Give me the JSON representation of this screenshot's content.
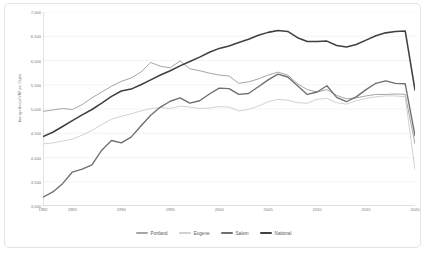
{
  "chart_data": {
    "type": "line",
    "title": "",
    "xlabel": "",
    "ylabel": "Average Annual VMT per Capita",
    "xlim": [
      1982,
      2020
    ],
    "ylim": [
      3000,
      7000
    ],
    "grid": true,
    "legend_position": "bottom",
    "ytick_labels": [
      "7,000",
      "6,500",
      "6,000",
      "5,500",
      "5,000",
      "4,500",
      "4,000",
      "3,500",
      "3,000"
    ],
    "ytick_values": [
      7000,
      6500,
      6000,
      5500,
      5000,
      4500,
      4000,
      3500,
      3000
    ],
    "xtick_labels": [
      "1982",
      "1985",
      "1990",
      "1995",
      "2000",
      "2005",
      "2010",
      "2015",
      "2020"
    ],
    "xtick_values": [
      1982,
      1985,
      1990,
      1995,
      2000,
      2005,
      2010,
      2015,
      2020
    ],
    "x": [
      1982,
      1983,
      1984,
      1985,
      1986,
      1987,
      1988,
      1989,
      1990,
      1991,
      1992,
      1993,
      1994,
      1995,
      1996,
      1997,
      1998,
      1999,
      2000,
      2001,
      2002,
      2003,
      2004,
      2005,
      2006,
      2007,
      2008,
      2009,
      2010,
      2011,
      2012,
      2013,
      2014,
      2015,
      2016,
      2017,
      2018,
      2019,
      2020
    ],
    "series": [
      {
        "name": "Portland",
        "color": "#a6a6a6",
        "width": 1.0,
        "values": [
          4950,
          4980,
          5010,
          4990,
          5090,
          5230,
          5350,
          5470,
          5570,
          5640,
          5760,
          5960,
          5880,
          5850,
          5990,
          5830,
          5790,
          5740,
          5700,
          5680,
          5530,
          5560,
          5620,
          5700,
          5760,
          5700,
          5520,
          5400,
          5350,
          5400,
          5280,
          5210,
          5230,
          5270,
          5300,
          5300,
          5310,
          5300,
          4280
        ]
      },
      {
        "name": "Eugene",
        "color": "#d2d2d2",
        "width": 1.0,
        "values": [
          4280,
          4300,
          4340,
          4380,
          4460,
          4560,
          4680,
          4790,
          4850,
          4900,
          4960,
          5010,
          5030,
          5010,
          5060,
          5040,
          5010,
          5020,
          5050,
          5040,
          4960,
          4990,
          5060,
          5150,
          5200,
          5180,
          5130,
          5120,
          5200,
          5220,
          5130,
          5100,
          5170,
          5220,
          5250,
          5270,
          5270,
          5250,
          3750
        ]
      },
      {
        "name": "Salem",
        "color": "#6e6e6e",
        "width": 1.35,
        "values": [
          3180,
          3290,
          3460,
          3700,
          3760,
          3850,
          4150,
          4350,
          4300,
          4420,
          4650,
          4870,
          5040,
          5160,
          5230,
          5120,
          5170,
          5310,
          5430,
          5420,
          5300,
          5320,
          5460,
          5600,
          5720,
          5660,
          5480,
          5300,
          5350,
          5480,
          5240,
          5150,
          5250,
          5400,
          5530,
          5580,
          5530,
          5520,
          4450
        ]
      },
      {
        "name": "National",
        "color": "#404040",
        "width": 1.55,
        "values": [
          4430,
          4520,
          4640,
          4760,
          4880,
          4990,
          5120,
          5260,
          5370,
          5410,
          5500,
          5600,
          5700,
          5790,
          5890,
          5980,
          6070,
          6170,
          6250,
          6300,
          6370,
          6440,
          6520,
          6580,
          6620,
          6600,
          6470,
          6390,
          6390,
          6400,
          6310,
          6280,
          6330,
          6420,
          6510,
          6570,
          6600,
          6610,
          5390
        ]
      }
    ]
  },
  "legend": {
    "items": [
      {
        "label": "Portland",
        "color": "#a6a6a6",
        "height": "1.3px"
      },
      {
        "label": "Eugene",
        "color": "#d2d2d2",
        "height": "1.3px"
      },
      {
        "label": "Salem",
        "color": "#6e6e6e",
        "height": "1.9px"
      },
      {
        "label": "National",
        "color": "#404040",
        "height": "2.3px"
      }
    ]
  },
  "style": {
    "grid_color": "#efefef",
    "axis_color": "#b8b8b8",
    "text_color": "#7a7a7a",
    "frame_color": "#e3e3e3",
    "background": "#ffffff"
  }
}
